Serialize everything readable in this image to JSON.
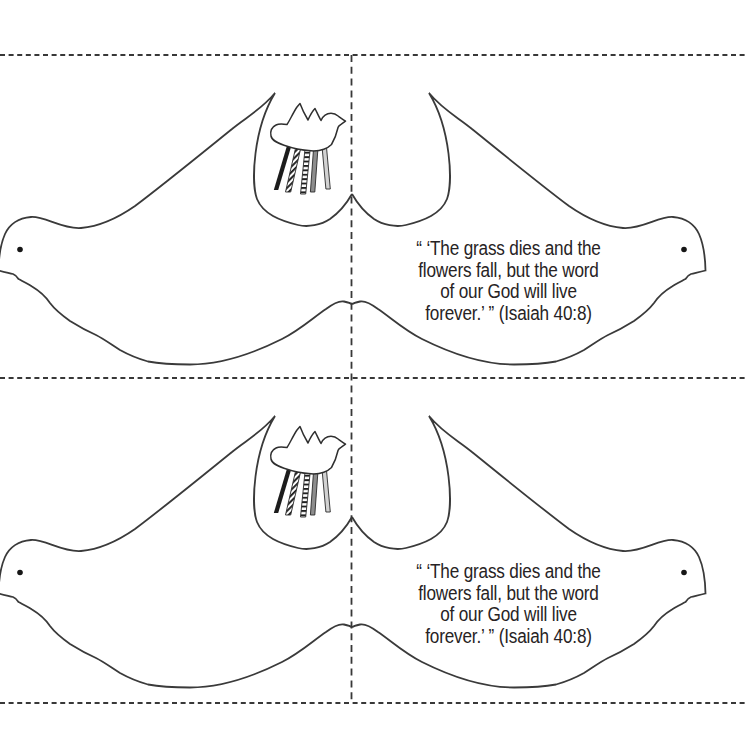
{
  "page": {
    "kind": "printable fold-over dove craft sheet",
    "background": "#ffffff",
    "card_count": 2
  },
  "verse": {
    "lines": [
      "“ ‘The grass dies and the",
      "flowers fall, but the word",
      "of our God will live",
      "forever.’ ” (Isaiah 40:8)"
    ],
    "reference": "Isaiah 40:8"
  },
  "colors": {
    "outline": "#3a3a3a",
    "guide_lines": "#383838",
    "text": "#272324",
    "ribbon_black": "#1c1c1c",
    "ribbon_stripe": "#1f1f1f",
    "ribbon_gray": "#8d8d8d",
    "ribbon_light_gray": "#d2d2d2",
    "eye": "#161616"
  },
  "graphics": {
    "dove_outline": "large mirrored fold-over dove",
    "mini_dove": "small dove with five hanging ribbons",
    "eye_dot": "black eye dot on each head",
    "cut_lines": "3 horizontal dashed cut lines",
    "fold_line": "1 vertical dashed fold line"
  }
}
